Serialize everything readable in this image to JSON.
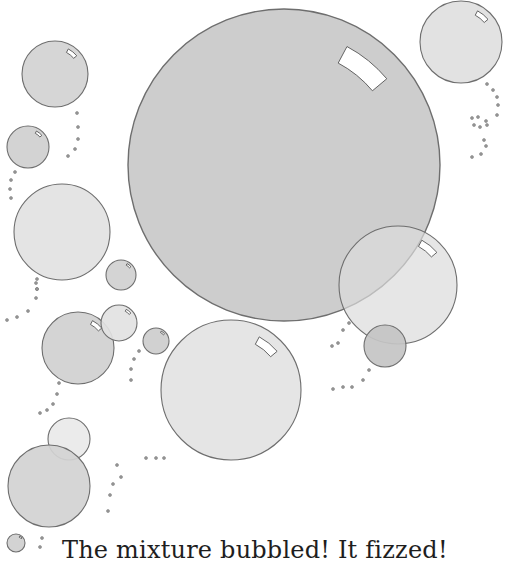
{
  "page": {
    "caption": "The mixture bubbled! It fizzed!",
    "background": "#ffffff"
  },
  "illustration": {
    "subject": "bubbles",
    "stroke_color": "#6e6e6e",
    "bubbles": [
      {
        "id": "giant",
        "cx": 284,
        "cy": 165,
        "r": 156,
        "fill": "#c9c9c9",
        "highlight": true
      },
      {
        "id": "top-right",
        "cx": 461,
        "cy": 42,
        "r": 41,
        "fill": "#e0e0e0",
        "highlight": true
      },
      {
        "id": "right-mid",
        "cx": 398,
        "cy": 285,
        "r": 59,
        "fill": "#dcdcdc",
        "highlight": true,
        "opacity": 0.7
      },
      {
        "id": "right-small",
        "cx": 385,
        "cy": 346,
        "r": 21,
        "fill": "#c4c4c4",
        "highlight": false
      },
      {
        "id": "center-bottom",
        "cx": 231,
        "cy": 390,
        "r": 70,
        "fill": "#e3e3e3",
        "highlight": true
      },
      {
        "id": "left-top",
        "cx": 55,
        "cy": 74,
        "r": 33,
        "fill": "#d2d2d2",
        "highlight": true
      },
      {
        "id": "left-small",
        "cx": 28,
        "cy": 147,
        "r": 21,
        "fill": "#cfcfcf",
        "highlight": true
      },
      {
        "id": "left-large",
        "cx": 62,
        "cy": 232,
        "r": 48,
        "fill": "#e2e2e2",
        "highlight": false
      },
      {
        "id": "tiny-1",
        "cx": 121,
        "cy": 275,
        "r": 15,
        "fill": "#d0d0d0",
        "highlight": true
      },
      {
        "id": "mid-left",
        "cx": 78,
        "cy": 348,
        "r": 36,
        "fill": "#d0d0d0",
        "highlight": true
      },
      {
        "id": "mid-left-2",
        "cx": 119,
        "cy": 323,
        "r": 18,
        "fill": "#e2e2e2",
        "highlight": true
      },
      {
        "id": "tiny-2",
        "cx": 156,
        "cy": 341,
        "r": 13,
        "fill": "#cdcdcd",
        "highlight": true
      },
      {
        "id": "bottom-left-overlap",
        "cx": 69,
        "cy": 439,
        "r": 21,
        "fill": "#e2e2e2",
        "highlight": false,
        "opacity": 0.7
      },
      {
        "id": "bottom-left",
        "cx": 49,
        "cy": 486,
        "r": 41,
        "fill": "#d3d3d3",
        "highlight": false
      },
      {
        "id": "tiny-corner",
        "cx": 16,
        "cy": 543,
        "r": 9,
        "fill": "#cfcfcf",
        "highlight": true
      }
    ],
    "dot_trails": [
      [
        [
          77,
          113
        ],
        [
          78,
          127
        ],
        [
          78,
          139
        ],
        [
          75,
          149
        ],
        [
          68,
          156
        ]
      ],
      [
        [
          15,
          172
        ],
        [
          11,
          180
        ],
        [
          10,
          189
        ],
        [
          11,
          198
        ]
      ],
      [
        [
          37,
          279
        ],
        [
          37,
          289
        ],
        [
          36,
          298
        ],
        [
          28,
          311
        ],
        [
          17,
          317
        ],
        [
          7,
          320
        ]
      ],
      [
        [
          36,
          283
        ],
        [
          37,
          289
        ]
      ],
      [
        [
          59,
          383
        ],
        [
          57,
          394
        ],
        [
          53,
          404
        ],
        [
          47,
          410
        ],
        [
          40,
          413
        ]
      ],
      [
        [
          139,
          351
        ],
        [
          134,
          359
        ],
        [
          131,
          369
        ],
        [
          131,
          380
        ]
      ],
      [
        [
          117,
          465
        ],
        [
          121,
          477
        ],
        [
          113,
          484
        ],
        [
          110,
          495
        ],
        [
          108,
          511
        ]
      ],
      [
        [
          146,
          458
        ],
        [
          156,
          458
        ],
        [
          164,
          458
        ]
      ],
      [
        [
          42,
          538
        ],
        [
          40,
          547
        ]
      ],
      [
        [
          349,
          323
        ],
        [
          343,
          330
        ],
        [
          338,
          343
        ],
        [
          332,
          346
        ]
      ],
      [
        [
          369,
          370
        ],
        [
          363,
          380
        ],
        [
          352,
          387
        ],
        [
          343,
          387
        ],
        [
          333,
          389
        ]
      ],
      [
        [
          487,
          84
        ],
        [
          493,
          90
        ],
        [
          497,
          97
        ],
        [
          498,
          105
        ],
        [
          497,
          115
        ],
        [
          487,
          125
        ],
        [
          484,
          140
        ],
        [
          486,
          146
        ],
        [
          481,
          154
        ],
        [
          472,
          157
        ]
      ],
      [
        [
          472,
          118
        ],
        [
          478,
          117
        ],
        [
          474,
          125
        ],
        [
          480,
          127
        ],
        [
          486,
          121
        ]
      ]
    ]
  }
}
